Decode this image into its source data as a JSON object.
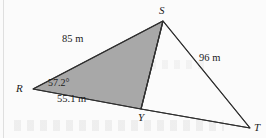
{
  "figure": {
    "type": "geometry-diagram",
    "canvas": {
      "width": 266,
      "height": 138
    },
    "colors": {
      "shaded_fill": "#a8a8a8",
      "stroke": "#333333",
      "background": "#fbfbfb",
      "text": "#1b1b1b"
    },
    "vertices": [
      {
        "id": "R",
        "label": "R",
        "x": 33,
        "y": 89,
        "label_x": 16,
        "label_y": 84
      },
      {
        "id": "S",
        "label": "S",
        "x": 163,
        "y": 21,
        "label_x": 159,
        "label_y": 6
      },
      {
        "id": "Y",
        "label": "Y",
        "x": 141,
        "y": 109,
        "label_x": 138,
        "label_y": 113
      },
      {
        "id": "T",
        "label": "T",
        "x": 250,
        "y": 128,
        "label_x": 254,
        "label_y": 123
      }
    ],
    "shaded_polygon": [
      "R",
      "S",
      "Y"
    ],
    "segments": [
      {
        "from": "R",
        "to": "S",
        "measure": "85 m"
      },
      {
        "from": "S",
        "to": "Y",
        "measure": ""
      },
      {
        "from": "R",
        "to": "Y",
        "measure": "55.1 m"
      },
      {
        "from": "S",
        "to": "T",
        "measure": "96 m"
      },
      {
        "from": "Y",
        "to": "T",
        "measure": ""
      }
    ],
    "side_labels": [
      {
        "id": "RS",
        "text": "85 m",
        "x": 72,
        "y": 40
      },
      {
        "id": "RY",
        "text": "55.1 m",
        "x": 60,
        "y": 99
      },
      {
        "id": "ST",
        "text": "96 m",
        "x": 200,
        "y": 55
      }
    ],
    "angle_labels": [
      {
        "id": "angle-R",
        "text": "57.2°",
        "x": 50,
        "y": 78,
        "at_vertex": "R"
      }
    ]
  }
}
